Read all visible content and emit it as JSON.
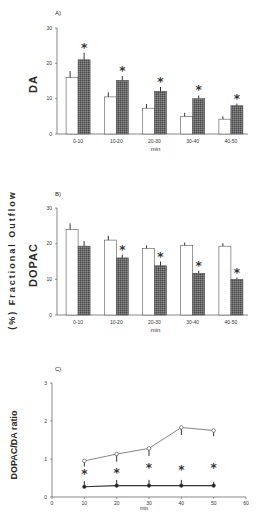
{
  "figure": {
    "shared_ylabel": "(%) Fractional Outflow"
  },
  "chart_data": [
    {
      "panel": "A)",
      "type": "bar",
      "ylabel": "DA",
      "xlabel": "min",
      "categories": [
        "0-10",
        "10-20",
        "20-30",
        "30-40",
        "40-50"
      ],
      "yticks": [
        0,
        10,
        20,
        30
      ],
      "ylim": [
        0,
        30
      ],
      "grid": false,
      "series": [
        {
          "name": "control (open bars)",
          "style": "open",
          "values": [
            16,
            10.5,
            7.3,
            5,
            4.2
          ],
          "errors": [
            1.8,
            1.3,
            1.2,
            1.0,
            0.8
          ]
        },
        {
          "name": "treated (hatched bars)",
          "style": "hatched",
          "values": [
            21,
            15.2,
            12.1,
            10,
            8
          ],
          "errors": [
            2.0,
            1.2,
            1.2,
            0.9,
            0.6
          ]
        }
      ],
      "significance": [
        "*",
        "*",
        "*",
        "*",
        "*"
      ]
    },
    {
      "panel": "B)",
      "type": "bar",
      "ylabel": "DOPAC",
      "xlabel": "min",
      "categories": [
        "0-10",
        "10-20",
        "20-30",
        "30-40",
        "40-50"
      ],
      "yticks": [
        0,
        10,
        20,
        30
      ],
      "ylim": [
        0,
        30
      ],
      "grid": false,
      "series": [
        {
          "name": "control (open bars)",
          "style": "open",
          "values": [
            24,
            21,
            18.7,
            19.5,
            19.3
          ],
          "errors": [
            1.7,
            1.2,
            0.8,
            0.8,
            0.8
          ]
        },
        {
          "name": "treated (hatched bars)",
          "style": "hatched",
          "values": [
            19.3,
            16,
            13.8,
            11.7,
            10
          ],
          "errors": [
            1.4,
            0.9,
            1.2,
            0.7,
            0.5
          ]
        }
      ],
      "significance": [
        "",
        "*",
        "*",
        "*",
        "*"
      ]
    },
    {
      "panel": "C)",
      "type": "line",
      "ylabel": "DOPAC/DA ratio",
      "xlabel": "min",
      "x": [
        10,
        20,
        30,
        40,
        50
      ],
      "xticks": [
        0,
        10,
        20,
        30,
        40,
        50,
        60
      ],
      "yticks": [
        0,
        1,
        2,
        3
      ],
      "xlim": [
        0,
        60
      ],
      "ylim": [
        0,
        3
      ],
      "grid": false,
      "series": [
        {
          "name": "control (open circles)",
          "marker": "open",
          "values": [
            0.95,
            1.13,
            1.28,
            1.83,
            1.75
          ],
          "errors": [
            0.15,
            0.2,
            0.2,
            0.2,
            0.15
          ]
        },
        {
          "name": "treated (filled circles)",
          "marker": "filled",
          "values": [
            0.27,
            0.3,
            0.3,
            0.3,
            0.3
          ],
          "errors": [
            0.15,
            0.15,
            0.15,
            0.15,
            0.1
          ]
        }
      ],
      "significance": [
        "*",
        "*",
        "*",
        "*",
        "*"
      ]
    }
  ]
}
